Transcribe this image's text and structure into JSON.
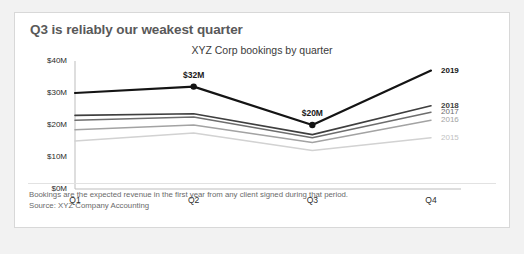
{
  "card": {
    "title": "Q3 is reliably our weakest quarter",
    "footnote_line1": "Bookings are the expected revenue in the first year from any client signed during that period.",
    "footnote_line2": "Source: XYZ Company Accounting"
  },
  "chart_data": {
    "type": "line",
    "title": "XYZ Corp bookings by quarter",
    "subtitle": "XYZ Corp bookings by quarter",
    "xlabel": "",
    "ylabel": "",
    "categories": [
      "Q1",
      "Q2",
      "Q3",
      "Q4"
    ],
    "ylim": [
      0,
      40
    ],
    "yticks": [
      0,
      10,
      20,
      30,
      40
    ],
    "ytick_labels": [
      "$0M",
      "$10M",
      "$20M",
      "$30M",
      "$40M"
    ],
    "grid": false,
    "legend_position": "right-inline",
    "series": [
      {
        "name": "2019",
        "values": [
          30,
          32,
          20,
          37
        ],
        "color": "#141414",
        "width": 2.2,
        "label_color": "#141414",
        "label_bold": true
      },
      {
        "name": "2018",
        "values": [
          23,
          23.5,
          17,
          26
        ],
        "color": "#3f3f3f",
        "width": 1.6,
        "label_color": "#3f3f3f",
        "label_bold": true
      },
      {
        "name": "2017",
        "values": [
          21.5,
          22.5,
          16,
          24
        ],
        "color": "#6e6e6e",
        "width": 1.5,
        "label_color": "#6e6e6e",
        "label_bold": false
      },
      {
        "name": "2016",
        "values": [
          18.5,
          20,
          14.5,
          21.5
        ],
        "color": "#a3a3a3",
        "width": 1.5,
        "label_color": "#a3a3a3",
        "label_bold": false
      },
      {
        "name": "2015",
        "values": [
          15,
          17.5,
          12,
          16
        ],
        "color": "#d2d2d2",
        "width": 1.5,
        "label_color": "#c2c2c2",
        "label_bold": false
      }
    ],
    "annotations": [
      {
        "text": "$32M",
        "series": "2019",
        "category": "Q2",
        "value": 32,
        "marker": true
      },
      {
        "text": "$20M",
        "series": "2019",
        "category": "Q3",
        "value": 20,
        "marker": true
      }
    ],
    "axis_color": "#bdbdbd"
  }
}
